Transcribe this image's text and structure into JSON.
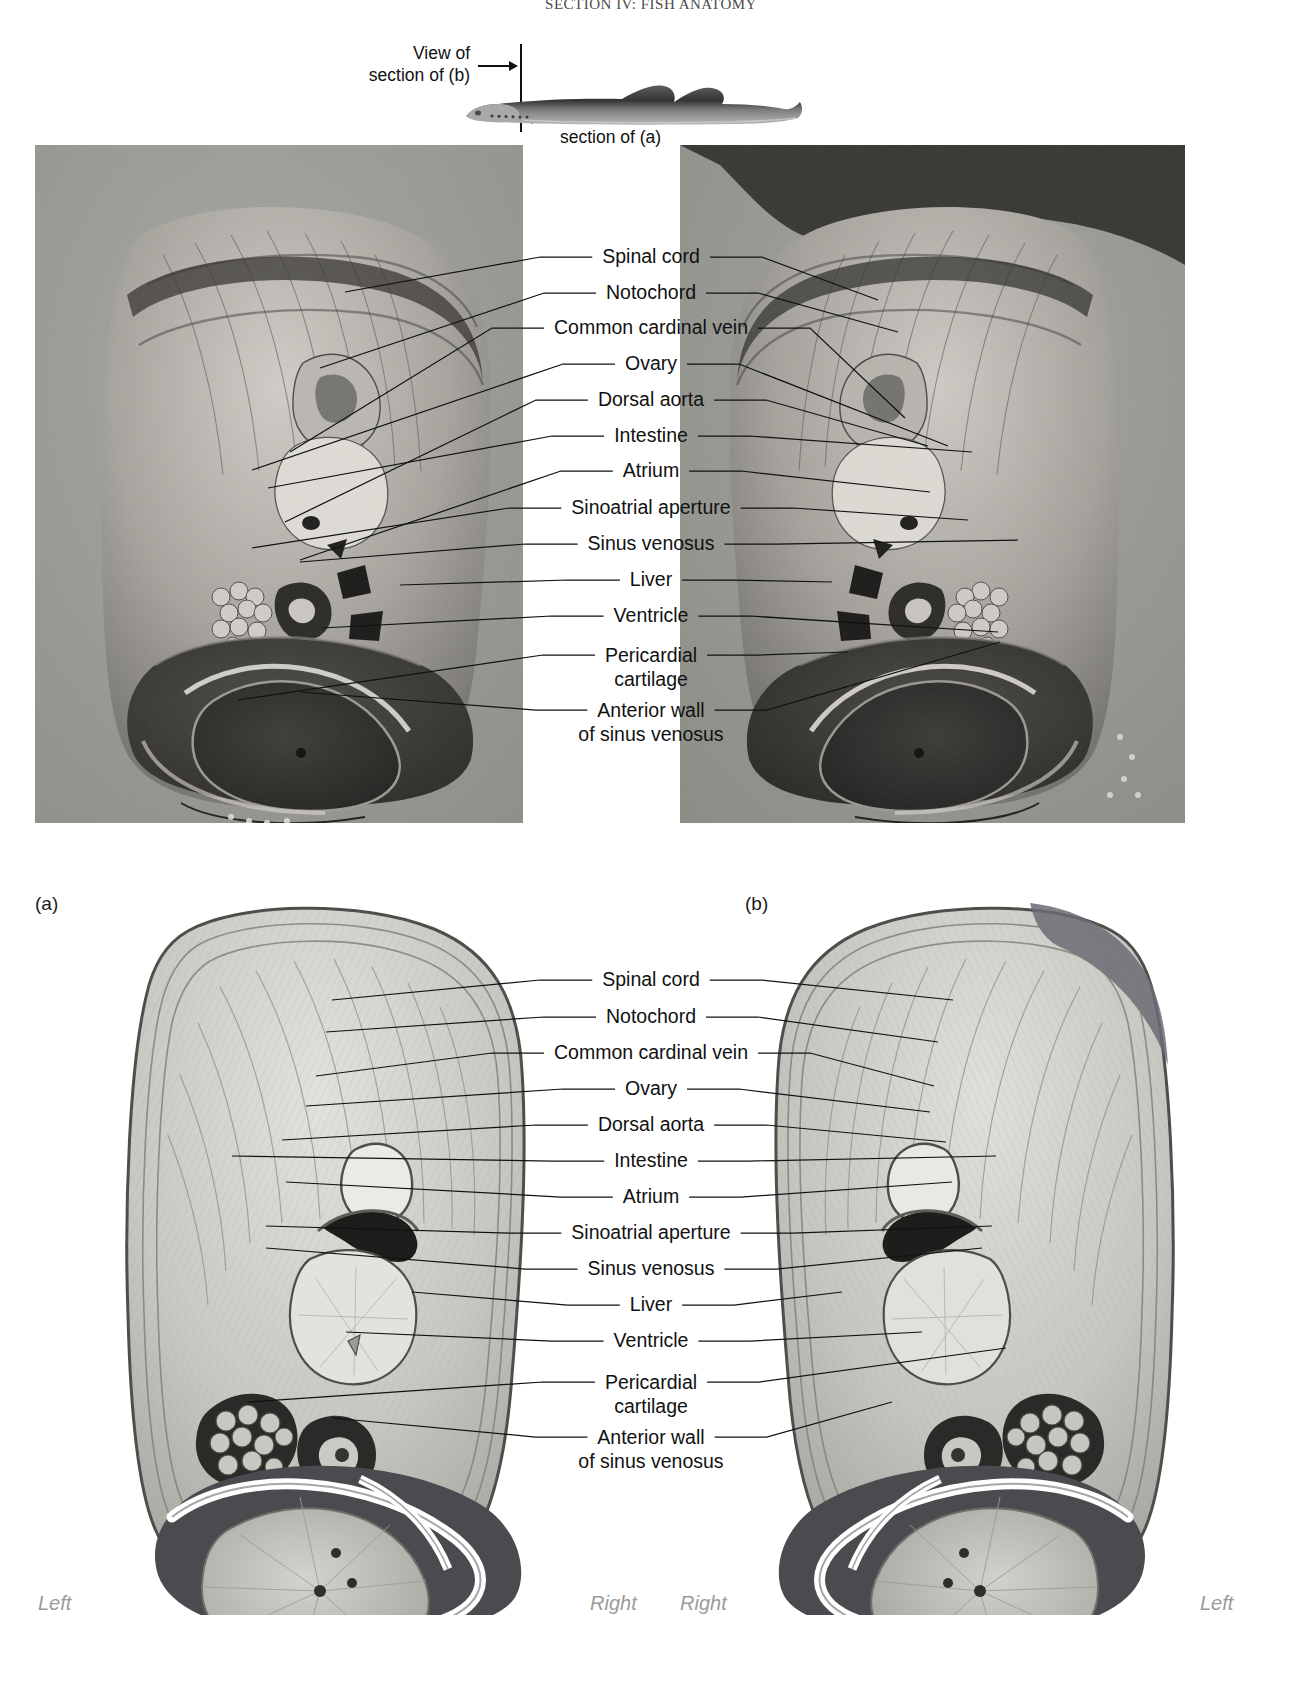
{
  "running_head": {
    "title": "SECTION IV: FISH ANATOMY",
    "folio": ""
  },
  "orientation_key": {
    "view_b_label": "View of\nsection of (b)",
    "view_b_line1": "View of",
    "view_b_line2": "section of (b)",
    "view_a_line1": "View of",
    "view_a_line2": "section of (a)",
    "specimen": "lamprey-lateral-silhouette"
  },
  "panels": {
    "photo_a_caption": "(a)",
    "photo_b_caption": "(b)",
    "photo_a_name": "cross-section-photograph-a",
    "photo_b_name": "cross-section-photograph-b",
    "drawing_left_name": "cross-section-drawing-a",
    "drawing_right_name": "cross-section-drawing-b"
  },
  "labels": [
    "Spinal cord",
    "Notochord",
    "Common cardinal vein",
    "Ovary",
    "Dorsal aorta",
    "Intestine",
    "Atrium",
    "Sinoatrial aperture",
    "Sinus venosus",
    "Liver",
    "Ventricle",
    "Pericardial\ncartilage",
    "Anterior wall\nof sinus venosus"
  ],
  "labels_multiline": [
    {
      "text": "Spinal cord",
      "lines": [
        "Spinal cord"
      ]
    },
    {
      "text": "Notochord",
      "lines": [
        "Notochord"
      ]
    },
    {
      "text": "Common cardinal vein",
      "lines": [
        "Common cardinal vein"
      ]
    },
    {
      "text": "Ovary",
      "lines": [
        "Ovary"
      ]
    },
    {
      "text": "Dorsal aorta",
      "lines": [
        "Dorsal aorta"
      ]
    },
    {
      "text": "Intestine",
      "lines": [
        "Intestine"
      ]
    },
    {
      "text": "Atrium",
      "lines": [
        "Atrium"
      ]
    },
    {
      "text": "Sinoatrial aperture",
      "lines": [
        "Sinoatrial aperture"
      ]
    },
    {
      "text": "Sinus venosus",
      "lines": [
        "Sinus venosus"
      ]
    },
    {
      "text": "Liver",
      "lines": [
        "Liver"
      ]
    },
    {
      "text": "Ventricle",
      "lines": [
        "Ventricle"
      ]
    },
    {
      "text": "Pericardial cartilage",
      "lines": [
        "Pericardial",
        "cartilage"
      ]
    },
    {
      "text": "Anterior wall of sinus venosus",
      "lines": [
        "Anterior wall",
        "of sinus venosus"
      ]
    }
  ],
  "orientation_words": {
    "left_outer": "Left",
    "right_inner_left_panel": "Right",
    "right_inner_right_panel": "Right",
    "left_outer_right_panel": "Left"
  },
  "colors": {
    "ink": "#111111",
    "photo_background": "#9a9a96",
    "orientation_word": "#9a9a9a",
    "tissue_light": "#d8d8d4",
    "tissue_mid": "#a9a9a5",
    "tissue_dark": "#4f5053",
    "tissue_darkest": "#232427",
    "highlight_white": "#ffffff"
  }
}
